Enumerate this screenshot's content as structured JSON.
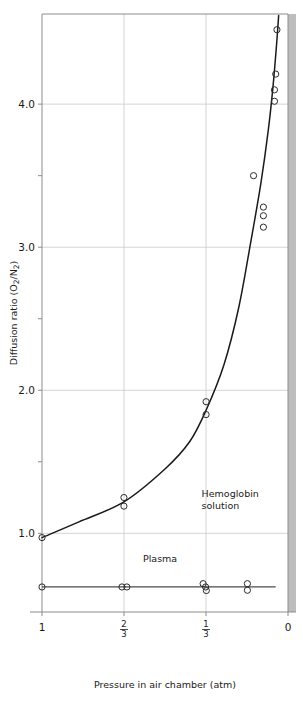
{
  "chart_data": {
    "type": "scatter",
    "title": "",
    "xlabel": "Pressure in air chamber (atm)",
    "ylabel": "Diffusion ratio (O2/N2)",
    "ylabel_parts": {
      "prefix": "Diffusion ratio (O",
      "sub1": "2",
      "mid": "/N",
      "sub2": "2",
      "suffix": ")"
    },
    "x_axis": {
      "ticks": [
        "1",
        "2/3",
        "1/3",
        "0"
      ],
      "tick_values": [
        1,
        0.6667,
        0.3333,
        0
      ],
      "tick_display": [
        {
          "kind": "plain",
          "text": "1"
        },
        {
          "kind": "fraction",
          "numerator": "2",
          "denominator": "3"
        },
        {
          "kind": "fraction",
          "numerator": "1",
          "denominator": "3"
        },
        {
          "kind": "plain",
          "text": "0"
        }
      ],
      "range": [
        1,
        0
      ],
      "direction": "reversed",
      "grid": true
    },
    "y_axis": {
      "ticks": [
        "1.0",
        "2.0",
        "3.0",
        "4.0"
      ],
      "tick_values": [
        1.0,
        2.0,
        3.0,
        4.0
      ],
      "minor_tick_values": [
        1.5,
        2.5,
        3.5
      ],
      "range": [
        0.45,
        4.63
      ],
      "grid": true
    },
    "series": [
      {
        "name": "Hemoglobin solution",
        "label": "Hemoglobin",
        "label_line2": "solution",
        "label_x": 0.4,
        "label_y": 1.28,
        "marker": "open-circle",
        "points": [
          {
            "x": 1.0,
            "y": 0.97
          },
          {
            "x": 0.667,
            "y": 1.25
          },
          {
            "x": 0.667,
            "y": 1.19
          },
          {
            "x": 0.333,
            "y": 1.92
          },
          {
            "x": 0.333,
            "y": 1.83
          },
          {
            "x": 0.14,
            "y": 3.5
          },
          {
            "x": 0.1,
            "y": 3.28
          },
          {
            "x": 0.1,
            "y": 3.22
          },
          {
            "x": 0.1,
            "y": 3.14
          },
          {
            "x": 0.055,
            "y": 4.02
          },
          {
            "x": 0.055,
            "y": 4.1
          },
          {
            "x": 0.05,
            "y": 4.21
          },
          {
            "x": 0.045,
            "y": 4.52
          }
        ],
        "curve": [
          {
            "x": 1.0,
            "y": 0.97
          },
          {
            "x": 0.85,
            "y": 1.08
          },
          {
            "x": 0.667,
            "y": 1.22
          },
          {
            "x": 0.5,
            "y": 1.45
          },
          {
            "x": 0.4,
            "y": 1.64
          },
          {
            "x": 0.333,
            "y": 1.86
          },
          {
            "x": 0.26,
            "y": 2.18
          },
          {
            "x": 0.2,
            "y": 2.58
          },
          {
            "x": 0.15,
            "y": 3.05
          },
          {
            "x": 0.11,
            "y": 3.45
          },
          {
            "x": 0.08,
            "y": 3.82
          },
          {
            "x": 0.06,
            "y": 4.14
          },
          {
            "x": 0.045,
            "y": 4.45
          },
          {
            "x": 0.038,
            "y": 4.62
          }
        ]
      },
      {
        "name": "Plasma",
        "label": "Plasma",
        "label_x": 0.52,
        "label_y": 0.8,
        "marker": "open-circle",
        "points": [
          {
            "x": 1.0,
            "y": 0.625
          },
          {
            "x": 0.675,
            "y": 0.625
          },
          {
            "x": 0.655,
            "y": 0.625
          },
          {
            "x": 0.345,
            "y": 0.648
          },
          {
            "x": 0.335,
            "y": 0.625
          },
          {
            "x": 0.332,
            "y": 0.6
          },
          {
            "x": 0.165,
            "y": 0.648
          },
          {
            "x": 0.165,
            "y": 0.602
          }
        ],
        "line": [
          {
            "x": 1.0,
            "y": 0.625
          },
          {
            "x": 0.05,
            "y": 0.625
          }
        ]
      }
    ]
  },
  "figure": {
    "caption": ""
  }
}
